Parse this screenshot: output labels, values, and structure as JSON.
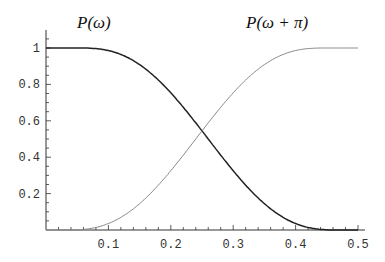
{
  "chart_data": {
    "type": "line",
    "title": "",
    "xlabel": "",
    "ylabel": "",
    "xlim": [
      0,
      0.5
    ],
    "ylim": [
      0,
      1.05
    ],
    "x_ticks": [
      "0.1",
      "0.2",
      "0.3",
      "0.4",
      "0.5"
    ],
    "y_ticks": [
      "0.2",
      "0.4",
      "0.6",
      "0.8",
      "1"
    ],
    "grid": false,
    "legend": "inline labels",
    "annotations": [
      {
        "text": "P(ω)",
        "near": "left curve"
      },
      {
        "text": "P(ω + π)",
        "near": "right curve"
      }
    ],
    "series": [
      {
        "name": "P(ω)",
        "color": "#222222",
        "x": [
          0,
          0.05,
          0.1,
          0.15,
          0.2,
          0.25,
          0.3,
          0.35,
          0.4,
          0.45,
          0.5
        ],
        "y": [
          1,
          1,
          0.995,
          0.96,
          0.86,
          0.7,
          0.45,
          0.2,
          0.05,
          0.005,
          0
        ]
      },
      {
        "name": "P(ω + π)",
        "color": "#888888",
        "x": [
          0,
          0.05,
          0.1,
          0.15,
          0.2,
          0.25,
          0.3,
          0.35,
          0.4,
          0.45,
          0.5
        ],
        "y": [
          0,
          0,
          0.005,
          0.05,
          0.2,
          0.45,
          0.7,
          0.86,
          0.96,
          0.995,
          1
        ]
      }
    ]
  },
  "labels": {
    "left": "P(ω)",
    "right": "P(ω + π)"
  }
}
